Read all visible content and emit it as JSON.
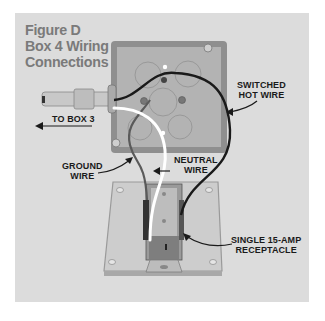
{
  "figure": {
    "title_lines": [
      "Figure D",
      "Box 4 Wiring",
      "Connections"
    ]
  },
  "labels": {
    "to_box": "TO BOX 3",
    "switched_hot_line1": "SWITCHED",
    "switched_hot_line2": "HOT WIRE",
    "ground_line1": "GROUND",
    "ground_line2": "WIRE",
    "neutral_line1": "NEUTRAL",
    "neutral_line2": "WIRE",
    "receptacle_line1": "SINGLE 15-AMP",
    "receptacle_line2": "RECEPTACLE"
  },
  "colors": {
    "background": "#ffffff",
    "panel": "#dcdcdc",
    "title": "#7a7a7a",
    "label_text": "#1a1a1a",
    "hot_wire": "#1a1a1a",
    "neutral_wire": "#ffffff",
    "ground_wire": "#555555"
  }
}
